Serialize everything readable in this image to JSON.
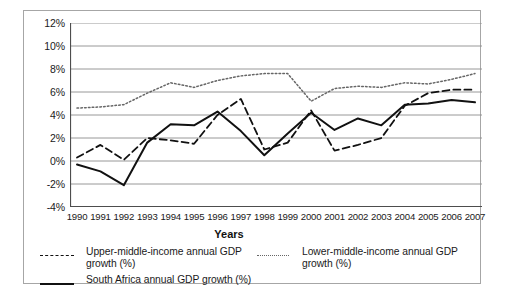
{
  "chart_data": {
    "type": "line",
    "title": "",
    "xlabel": "Years",
    "ylabel": "",
    "grid": true,
    "legend_position": "bottom",
    "ylim": [
      -4,
      12
    ],
    "ytick_labels": [
      "12%",
      "10%",
      "8%",
      "6%",
      "4%",
      "2%",
      "0%",
      "-2%",
      "-4%"
    ],
    "ytick_values": [
      12,
      10,
      8,
      6,
      4,
      2,
      0,
      -2,
      -4
    ],
    "categories": [
      "1990",
      "1991",
      "1992",
      "1993",
      "1994",
      "1995",
      "1996",
      "1997",
      "1998",
      "1999",
      "2000",
      "2001",
      "2002",
      "2003",
      "2004",
      "2005",
      "2006",
      "2007"
    ],
    "series": [
      {
        "name": "Upper-middle-income annual GDP growth (%)",
        "style": "dashed",
        "color": "#111111",
        "values": [
          0.3,
          1.4,
          0.1,
          2.0,
          1.8,
          1.5,
          4.0,
          5.4,
          1.0,
          1.6,
          4.4,
          0.9,
          1.4,
          2.0,
          4.8,
          5.9,
          6.2,
          6.2
        ]
      },
      {
        "name": "Lower-middle-income annual GDP growth (%)",
        "style": "dotted",
        "color": "#666666",
        "values": [
          4.6,
          4.7,
          4.9,
          5.9,
          6.8,
          6.4,
          7.0,
          7.4,
          7.6,
          7.6,
          5.2,
          6.3,
          6.5,
          6.4,
          6.8,
          6.7,
          7.1,
          7.6
        ]
      },
      {
        "name": "South Africa annual GDP growth (%)",
        "style": "solid",
        "color": "#111111",
        "values": [
          -0.3,
          -0.9,
          -2.1,
          1.6,
          3.2,
          3.1,
          4.3,
          2.6,
          0.5,
          2.4,
          4.2,
          2.7,
          3.7,
          3.1,
          4.9,
          5.0,
          5.3,
          5.1
        ]
      }
    ]
  },
  "axis": {
    "x_title": "Years"
  },
  "legend": {
    "entries": [
      {
        "label": "Upper-middle-income annual GDP growth (%)",
        "marker": "dashed-line-swatch"
      },
      {
        "label": "Lower-middle-income annual GDP growth (%)",
        "marker": "dotted-line-swatch"
      },
      {
        "label": "South Africa annual GDP growth (%)",
        "marker": "solid-line-swatch"
      }
    ]
  }
}
